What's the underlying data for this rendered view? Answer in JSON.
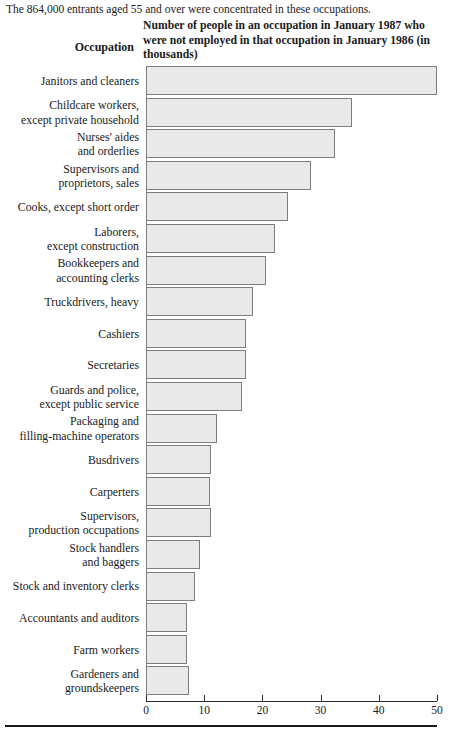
{
  "intro": "The 864,000 entrants aged 55 and over were concentrated in these occupations.",
  "headings": {
    "occupation": "Occupation",
    "value": "Number of people in an occupation in January 1987 who were not employed in that occupation in January 1986 (in thousands)"
  },
  "colors": {
    "bar_fill": "#e9e9e9",
    "bar_border": "#7d7d7d",
    "axis": "#2a2a2a",
    "text": "#1a1a1a",
    "background": "#ffffff"
  },
  "chart_data": {
    "type": "bar",
    "orientation": "horizontal",
    "title": "Number of people in an occupation in January 1987 who were not employed in that occupation in January 1986 (in thousands)",
    "xlabel": "",
    "ylabel": "Occupation",
    "xlim": [
      0,
      50
    ],
    "xticks": [
      0,
      10,
      20,
      30,
      40,
      50
    ],
    "xtick_labels": [
      "0",
      "10",
      "20",
      "30",
      "40",
      "50"
    ],
    "grid": false,
    "legend": false,
    "units": "thousands",
    "categories": [
      "Janitors and cleaners",
      "Childcare workers,\nexcept private household",
      "Nurses' aides\nand orderlies",
      "Supervisors and\nproprietors, sales",
      "Cooks, except short order",
      "Laborers,\nexcept construction",
      "Bookkeepers and\naccounting clerks",
      "Truckdrivers, heavy",
      "Cashiers",
      "Secretaries",
      "Guards and police,\nexcept public service",
      "Packaging and\nfilling-machine operators",
      "Busdrivers",
      "Carperters",
      "Supervisors,\nproduction occupations",
      "Stock handlers\nand baggers",
      "Stock and inventory clerks",
      "Accountants and auditors",
      "Farm workers",
      "Gardeners and\ngroundskeepers"
    ],
    "values": [
      50.0,
      35.4,
      32.5,
      28.3,
      24.4,
      22.2,
      20.6,
      18.4,
      17.2,
      17.2,
      16.5,
      12.2,
      11.2,
      11.0,
      11.2,
      9.3,
      8.4,
      7.1,
      7.1,
      7.4
    ]
  }
}
